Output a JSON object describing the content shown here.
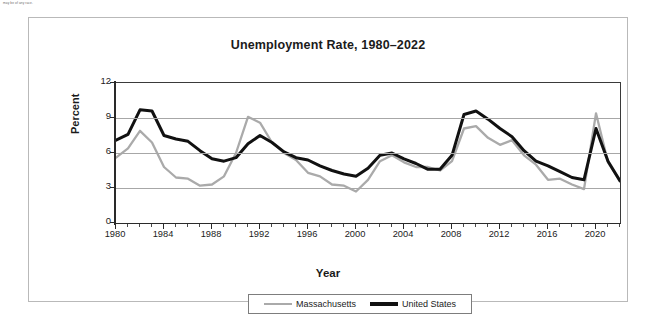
{
  "footnote": "may be of any race.",
  "chart_data": {
    "type": "line",
    "title": "Unemployment Rate, 1980–2022",
    "xlabel": "Year",
    "ylabel": "Percent",
    "xlim": [
      1980,
      2022
    ],
    "ylim": [
      0,
      12
    ],
    "yticks": [
      0,
      3,
      6,
      9,
      12
    ],
    "xticks": [
      1980,
      1984,
      1988,
      1992,
      1996,
      2000,
      2004,
      2008,
      2012,
      2016,
      2020
    ],
    "xtick_labels": [
      "1980",
      "1984",
      "1988",
      "1992",
      "1996",
      "2000",
      "2004",
      "2008",
      "2012",
      "2016",
      "2020"
    ],
    "ytick_labels": [
      "0",
      "3",
      "6",
      "9",
      "12"
    ],
    "grid": true,
    "grid_axis": "y",
    "legend_position": "bottom",
    "x": [
      1980,
      1981,
      1982,
      1983,
      1984,
      1985,
      1986,
      1987,
      1988,
      1989,
      1990,
      1991,
      1992,
      1993,
      1994,
      1995,
      1996,
      1997,
      1998,
      1999,
      2000,
      2001,
      2002,
      2003,
      2004,
      2005,
      2006,
      2007,
      2008,
      2009,
      2010,
      2011,
      2012,
      2013,
      2014,
      2015,
      2016,
      2017,
      2018,
      2019,
      2020,
      2021,
      2022
    ],
    "series": [
      {
        "name": "Massachusetts",
        "color": "#aaaaaa",
        "values": [
          5.6,
          6.4,
          7.9,
          6.9,
          4.8,
          3.9,
          3.8,
          3.2,
          3.3,
          4.0,
          6.0,
          9.1,
          8.6,
          6.9,
          6.0,
          5.4,
          4.3,
          4.0,
          3.3,
          3.2,
          2.7,
          3.7,
          5.3,
          5.8,
          5.2,
          4.8,
          4.8,
          4.5,
          5.3,
          8.1,
          8.3,
          7.3,
          6.7,
          7.1,
          5.8,
          5.0,
          3.7,
          3.8,
          3.3,
          2.9,
          9.4,
          5.2,
          3.6
        ]
      },
      {
        "name": "United States",
        "color": "#111111",
        "values": [
          7.1,
          7.6,
          9.7,
          9.6,
          7.5,
          7.2,
          7.0,
          6.2,
          5.5,
          5.3,
          5.6,
          6.8,
          7.5,
          6.9,
          6.1,
          5.6,
          5.4,
          4.9,
          4.5,
          4.2,
          4.0,
          4.7,
          5.8,
          6.0,
          5.5,
          5.1,
          4.6,
          4.6,
          5.8,
          9.3,
          9.6,
          8.9,
          8.1,
          7.4,
          6.2,
          5.3,
          4.9,
          4.4,
          3.9,
          3.7,
          8.1,
          5.3,
          3.6
        ]
      }
    ]
  },
  "legend": {
    "entries": [
      {
        "label": "Massachusetts"
      },
      {
        "label": "United States"
      }
    ]
  }
}
